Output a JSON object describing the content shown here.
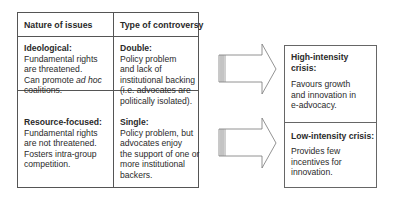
{
  "table": {
    "headers": [
      "Nature of issues",
      "Type of controversy"
    ],
    "rows": [
      {
        "nature_title": "Ideological:",
        "nature_lines": [
          "Fundamental rights",
          "are threatened.",
          "Can promote ",
          "coalitions."
        ],
        "nature_italic": "ad hoc",
        "type_title": "Double:",
        "type_lines": [
          "Policy problem",
          "and lack of",
          "institutional backing",
          "(i.e. advocates are",
          "politically isolated)."
        ]
      },
      {
        "nature_title": "Resource-focused:",
        "nature_lines": [
          "Fundamental rights",
          "are not threatened.",
          "Fosters intra-group",
          "competition."
        ],
        "type_title": "Single:",
        "type_lines": [
          "Policy problem, but",
          "advocates enjoy",
          "the support of one or",
          "more institutional",
          "backers."
        ]
      }
    ]
  },
  "outcomes": [
    {
      "title_lines": [
        "High-intensity",
        "crisis:"
      ],
      "desc_lines": [
        "Favours growth",
        "and innovation in",
        "e-advocacy."
      ]
    },
    {
      "title_lines": [
        "Low-intensity crisis:"
      ],
      "desc_lines": [
        "Provides few",
        "incentives for",
        "innovation."
      ]
    }
  ],
  "arrows": [
    "arrow-right",
    "arrow-right"
  ]
}
